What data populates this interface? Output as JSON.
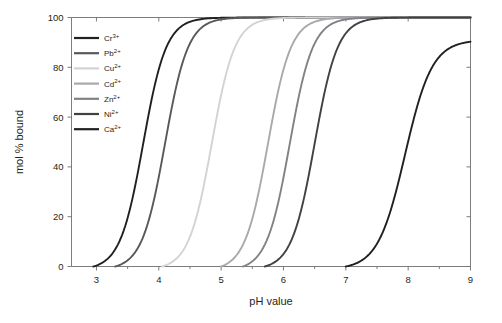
{
  "chart_data": {
    "type": "line",
    "title": "",
    "xlabel": "pH value",
    "ylabel": "mol % bound",
    "xlim": [
      2.6,
      9.0
    ],
    "ylim": [
      0,
      100
    ],
    "xticks": [
      3,
      4,
      5,
      6,
      7,
      8,
      9
    ],
    "xtick_labels": [
      "3",
      "4",
      "5",
      "6",
      "7",
      "8",
      "9"
    ],
    "yticks": [
      0,
      20,
      40,
      60,
      80,
      100
    ],
    "ytick_labels": [
      "0",
      "20",
      "40",
      "60",
      "80",
      "100"
    ],
    "grid": false,
    "legend_position": "top-left",
    "series": [
      {
        "name": "Cr3+",
        "label_base": "Cr",
        "label_sup": "3+",
        "color": "#231f20",
        "midpoint_ph": 3.75,
        "steepness": 2.35,
        "plateau": 100,
        "onset_ph": 2.95,
        "x": [
          2.9,
          3.0,
          3.2,
          3.4,
          3.6,
          3.75,
          3.9,
          4.1,
          4.3,
          4.5,
          4.8,
          5.2,
          6.0,
          7.0,
          8.0,
          9.0
        ],
        "y": [
          0,
          1,
          7,
          20,
          40,
          50,
          62,
          78,
          88,
          94,
          98,
          99.6,
          100,
          100,
          100,
          100
        ]
      },
      {
        "name": "Pb2+",
        "label_base": "Pb",
        "label_sup": "2+",
        "color": "#58595b",
        "midpoint_ph": 4.1,
        "steepness": 2.35,
        "plateau": 100,
        "onset_ph": 3.3,
        "x": [
          3.25,
          3.4,
          3.6,
          3.8,
          4.0,
          4.1,
          4.25,
          4.45,
          4.65,
          4.9,
          5.2,
          5.6,
          6.3,
          7.2,
          8.2,
          9.0
        ],
        "y": [
          0,
          2,
          9,
          23,
          42,
          50,
          63,
          78,
          88,
          94,
          98,
          99.6,
          100,
          100,
          100,
          100
        ]
      },
      {
        "name": "Cu2+",
        "label_base": "Cu",
        "label_sup": "2+",
        "color": "#d1d3d4",
        "midpoint_ph": 4.85,
        "steepness": 2.35,
        "plateau": 100,
        "onset_ph": 4.05,
        "x": [
          4.0,
          4.15,
          4.35,
          4.55,
          4.75,
          4.85,
          5.0,
          5.2,
          5.4,
          5.65,
          5.95,
          6.35,
          7.0,
          7.8,
          8.5,
          9.0
        ],
        "y": [
          0,
          2,
          9,
          23,
          42,
          50,
          63,
          78,
          88,
          94,
          98,
          99.6,
          100,
          100,
          100,
          100
        ]
      },
      {
        "name": "Cd2+",
        "label_base": "Cd",
        "label_sup": "2+",
        "color": "#a7a9ac",
        "midpoint_ph": 5.75,
        "steepness": 2.35,
        "plateau": 100,
        "onset_ph": 5.0,
        "x": [
          4.95,
          5.1,
          5.3,
          5.5,
          5.65,
          5.75,
          5.9,
          6.1,
          6.3,
          6.55,
          6.85,
          7.25,
          7.9,
          8.4,
          8.8,
          9.0
        ],
        "y": [
          0,
          2,
          9,
          23,
          42,
          50,
          63,
          78,
          88,
          94,
          98,
          99.6,
          100,
          100,
          100,
          100
        ]
      },
      {
        "name": "Zn2+",
        "label_base": "Zn",
        "label_sup": "2+",
        "color": "#808285",
        "midpoint_ph": 6.1,
        "steepness": 2.35,
        "plateau": 100,
        "onset_ph": 5.35,
        "x": [
          5.3,
          5.45,
          5.65,
          5.85,
          6.0,
          6.1,
          6.25,
          6.45,
          6.65,
          6.9,
          7.2,
          7.6,
          8.2,
          8.6,
          8.9,
          9.0
        ],
        "y": [
          0,
          2,
          9,
          23,
          42,
          50,
          63,
          78,
          88,
          94,
          98,
          99.6,
          100,
          100,
          100,
          100
        ]
      },
      {
        "name": "Ni2+",
        "label_base": "Ni",
        "label_sup": "2+",
        "color": "#414042",
        "midpoint_ph": 6.5,
        "steepness": 2.35,
        "plateau": 100,
        "onset_ph": 5.7,
        "x": [
          5.65,
          5.8,
          6.0,
          6.2,
          6.4,
          6.5,
          6.65,
          6.85,
          7.05,
          7.3,
          7.6,
          8.0,
          8.5,
          8.8,
          8.95,
          9.0
        ],
        "y": [
          0,
          2,
          9,
          23,
          42,
          50,
          63,
          78,
          88,
          94,
          98,
          99.6,
          100,
          100,
          100,
          100
        ]
      },
      {
        "name": "Ca2+",
        "label_base": "Ca",
        "label_sup": "2+",
        "color": "#231f20",
        "midpoint_ph": 7.95,
        "steepness": 2.0,
        "plateau": 91,
        "onset_ph": 7.0,
        "x": [
          6.95,
          7.15,
          7.35,
          7.55,
          7.75,
          7.95,
          8.15,
          8.35,
          8.55,
          8.75,
          8.9,
          9.0
        ],
        "y": [
          0,
          3,
          10,
          22,
          36,
          50,
          62,
          72,
          80,
          86,
          89,
          91
        ]
      }
    ]
  },
  "axis": {
    "x_title": "pH value",
    "y_title": "mol % bound"
  }
}
